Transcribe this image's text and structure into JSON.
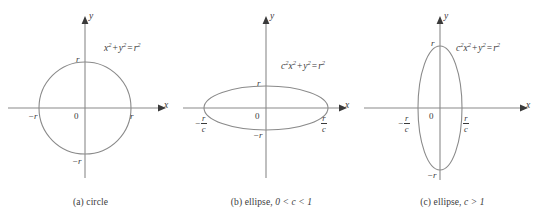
{
  "figure": {
    "background": "#ffffff",
    "curve_color": "#8a8a8a",
    "axis_color": "#8a8a8a",
    "text_color": "#3a3a3a"
  },
  "panels": [
    {
      "id": "a",
      "caption_prefix": "(a)",
      "caption_text": "circle",
      "caption_condition": "",
      "shape": "circle",
      "equation": {
        "c_coeff": "",
        "term1_base": "x",
        "term1_exp": "2",
        "plus": "+",
        "term2_base": "y",
        "term2_exp": "2",
        "equals": "=",
        "rhs_base": "r",
        "rhs_exp": "2"
      },
      "axis_x_label": "x",
      "axis_y_label": "y",
      "origin_label": "0",
      "x_left_label": "−r",
      "x_right_label": "r",
      "y_top_label": "r",
      "y_bottom_label": "−r",
      "x_label_type": "plain",
      "semi_x": 46,
      "semi_y": 46
    },
    {
      "id": "b",
      "caption_prefix": "(b)",
      "caption_text": "ellipse,",
      "caption_condition": "0 < c < 1",
      "shape": "ellipse-wide",
      "equation": {
        "c_coeff": "c",
        "c_exp": "2",
        "term1_base": "x",
        "term1_exp": "2",
        "plus": "+",
        "term2_base": "y",
        "term2_exp": "2",
        "equals": "=",
        "rhs_base": "r",
        "rhs_exp": "2"
      },
      "axis_x_label": "x",
      "axis_y_label": "y",
      "origin_label": "0",
      "x_left_label": "−r/c",
      "x_right_label": "r/c",
      "y_top_label": "r",
      "y_bottom_label": "−r",
      "x_label_type": "fraction",
      "frac_num": "r",
      "frac_den": "c",
      "frac_minus": "−",
      "semi_x": 62,
      "semi_y": 22
    },
    {
      "id": "c",
      "caption_prefix": "(c)",
      "caption_text": "ellipse,",
      "caption_condition": "c > 1",
      "shape": "ellipse-tall",
      "equation": {
        "c_coeff": "c",
        "c_exp": "2",
        "term1_base": "x",
        "term1_exp": "2",
        "plus": "+",
        "term2_base": "y",
        "term2_exp": "2",
        "equals": "=",
        "rhs_base": "r",
        "rhs_exp": "2"
      },
      "axis_x_label": "x",
      "axis_y_label": "y",
      "origin_label": "0",
      "x_left_label": "−r/c",
      "x_right_label": "r/c",
      "y_top_label": "r",
      "y_bottom_label": "−r",
      "x_label_type": "fraction",
      "frac_num": "r",
      "frac_den": "c",
      "frac_minus": "−",
      "semi_x": 22,
      "semi_y": 62
    }
  ]
}
